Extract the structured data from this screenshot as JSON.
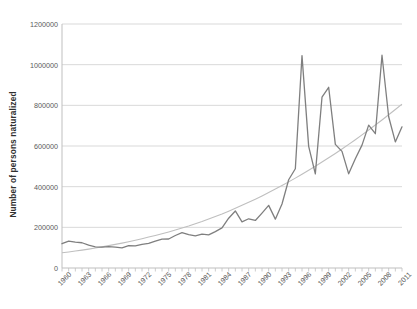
{
  "chart_data": {
    "type": "line",
    "title": "",
    "xlabel": "",
    "ylabel": "Number of persons naturalized",
    "ylim": [
      0,
      1200000
    ],
    "ytick_values": [
      0,
      200000,
      400000,
      600000,
      800000,
      1000000,
      1200000
    ],
    "ytick_labels": [
      "0",
      "200000",
      "400000",
      "600000",
      "800000",
      "1000000",
      "1200000"
    ],
    "grid": true,
    "legend": "none",
    "xlim": [
      1960,
      2011
    ],
    "xtick_labels": [
      "1960",
      "1963",
      "1966",
      "1969",
      "1972",
      "1975",
      "1978",
      "1981",
      "1984",
      "1987",
      "1990",
      "1993",
      "1996",
      "1999",
      "2002",
      "2005",
      "2008",
      "2011"
    ],
    "xtick_values": [
      1960,
      1963,
      1966,
      1969,
      1972,
      1975,
      1978,
      1981,
      1984,
      1987,
      1990,
      1993,
      1996,
      1999,
      2002,
      2005,
      2008,
      2011
    ],
    "x": [
      1960,
      1961,
      1962,
      1963,
      1964,
      1965,
      1966,
      1967,
      1968,
      1969,
      1970,
      1971,
      1972,
      1973,
      1974,
      1975,
      1976,
      1977,
      1978,
      1979,
      1980,
      1981,
      1982,
      1983,
      1984,
      1985,
      1986,
      1987,
      1988,
      1989,
      1990,
      1991,
      1992,
      1993,
      1994,
      1995,
      1996,
      1997,
      1998,
      1999,
      2000,
      2001,
      2002,
      2003,
      2004,
      2005,
      2006,
      2007,
      2008,
      2009,
      2010,
      2011
    ],
    "series": [
      {
        "name": "Number of persons naturalized",
        "color": "#7f7f7f",
        "values": [
          119442,
          132450,
          127307,
          124178,
          112234,
          104299,
          103059,
          104902,
          102726,
          98709,
          110399,
          108407,
          116215,
          120740,
          131655,
          141537,
          142504,
          159873,
          173535,
          164150,
          157938,
          166317,
          163342,
          178948,
          197023,
          244717,
          280623,
          227008,
          242063,
          233777,
          270101,
          308058,
          240252,
          314681,
          434107,
          488088,
          1044689,
          598225,
          463060,
          839944,
          888788,
          608205,
          573708,
          463204,
          537151,
          604280,
          702589,
          660477,
          1046539,
          743715,
          619913,
          694193
        ]
      },
      {
        "name": "Trendline",
        "color": "#bfbfbf",
        "type": "poly-trend",
        "values": [
          75000,
          79000,
          83500,
          88000,
          93000,
          98500,
          104000,
          110000,
          116000,
          122500,
          129500,
          136500,
          144000,
          152000,
          160000,
          168500,
          177500,
          187000,
          197000,
          207000,
          218000,
          229000,
          241000,
          253500,
          266000,
          279500,
          293500,
          308000,
          323000,
          338500,
          354500,
          371000,
          388000,
          405500,
          423500,
          442000,
          461000,
          480500,
          500500,
          521000,
          542000,
          563500,
          585500,
          608000,
          631000,
          654500,
          678500,
          703000,
          728000,
          753500,
          779500,
          806000
        ]
      }
    ]
  }
}
